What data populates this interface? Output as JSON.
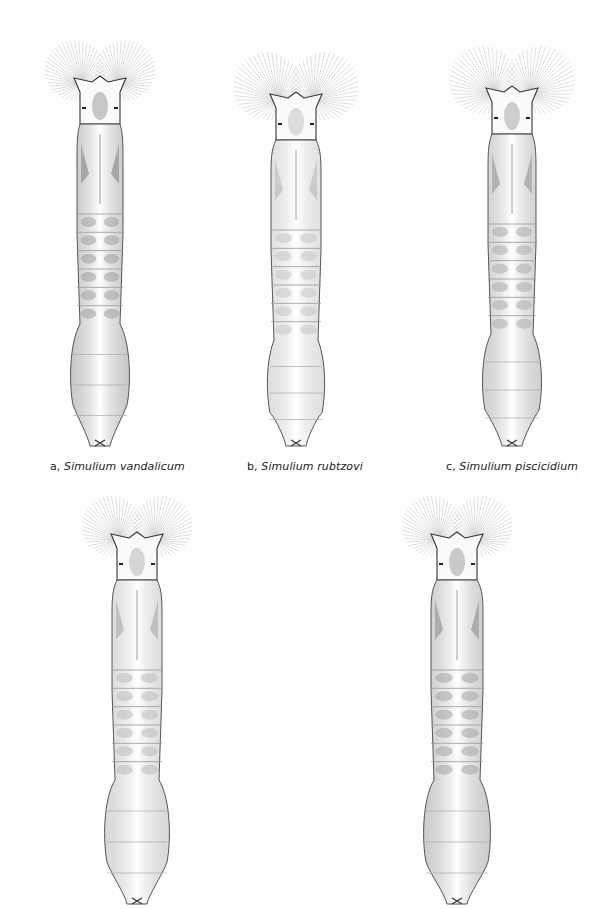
{
  "figure": {
    "panels": [
      {
        "id": "a",
        "label": "a,",
        "genus": "Simulium",
        "species": "vandalicum",
        "cx": 100,
        "top": 38,
        "length": 418,
        "fan_r": 30,
        "body_w": 46,
        "rear_w": 62,
        "shade": "#9a9a9a",
        "caption_x": 100,
        "caption_y": 460
      },
      {
        "id": "b",
        "label": "b,",
        "genus": "Simulium",
        "species": "rubtzovi",
        "cx": 296,
        "top": 50,
        "length": 406,
        "fan_r": 34,
        "body_w": 50,
        "rear_w": 60,
        "shade": "#c4c4c4",
        "caption_x": 297,
        "caption_y": 460
      },
      {
        "id": "c",
        "label": "c,",
        "genus": "Simulium",
        "species": "piscicidium",
        "cx": 512,
        "top": 44,
        "length": 412,
        "fan_r": 34,
        "body_w": 48,
        "rear_w": 62,
        "shade": "#a8a8a8",
        "caption_x": 506,
        "caption_y": 460
      },
      {
        "id": "d",
        "label": "",
        "genus": "",
        "species": "",
        "cx": 137,
        "top": 494,
        "length": 420,
        "fan_r": 30,
        "body_w": 50,
        "rear_w": 68,
        "shade": "#b8b8b8",
        "caption_x": 0,
        "caption_y": 0
      },
      {
        "id": "e",
        "label": "",
        "genus": "",
        "species": "",
        "cx": 457,
        "top": 494,
        "length": 420,
        "fan_r": 30,
        "body_w": 52,
        "rear_w": 70,
        "shade": "#a0a0a0",
        "caption_x": 0,
        "caption_y": 0
      }
    ]
  },
  "captions": {
    "a": {
      "label": "a,",
      "genus": "Simulium",
      "species": "vandalicum"
    },
    "b": {
      "label": "b,",
      "genus": "Simulium",
      "species": "rubtzovi"
    },
    "c": {
      "label": "c,",
      "genus": "Simulium",
      "species": "piscicidium"
    }
  }
}
